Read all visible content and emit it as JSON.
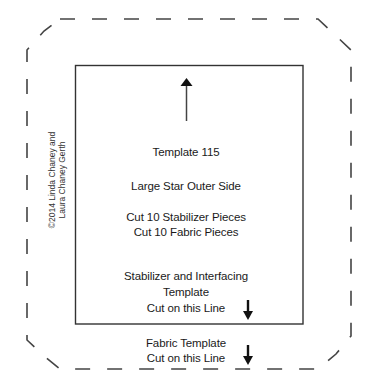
{
  "diagram": {
    "title": "Template 115",
    "name": "Large Star Outer Side",
    "cut_instructions": [
      "Cut 10 Stabilizer Pieces",
      "Cut 10 Fabric Pieces"
    ],
    "inner_label": {
      "line1": "Stabilizer and Interfacing",
      "line2": "Template",
      "line3": "Cut on this Line"
    },
    "outer_label": {
      "line1": "Fabric Template",
      "line2": "Cut on this Line"
    },
    "copyright": {
      "line1": "©2014 Linda Chaney and",
      "line2": "Laura Chaney Gerth"
    },
    "icons": {
      "grain_arrow": "arrow-up-icon",
      "inner_cut_arrow": "arrow-down-icon",
      "outer_cut_arrow": "arrow-down-icon"
    },
    "colors": {
      "line": "#333333",
      "dashed_line": "#444444",
      "text": "#1a1a1a",
      "background": "#ffffff"
    }
  }
}
